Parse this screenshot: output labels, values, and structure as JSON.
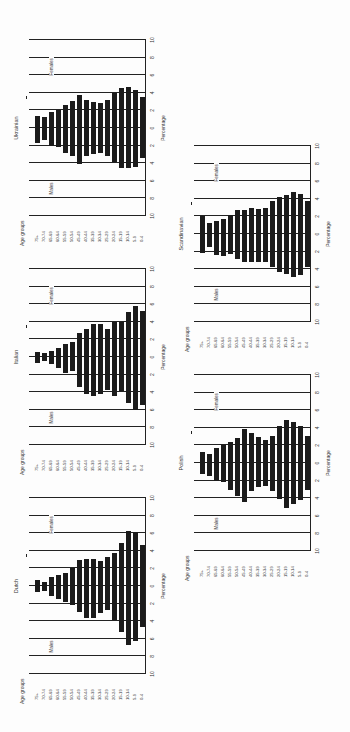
{
  "chart_data": [
    {
      "type": "bar",
      "subtype": "population-pyramid",
      "title": "Ukrainian",
      "xlabel": "Percentage",
      "ylabel": "Age groups",
      "xlim": [
        -10,
        10
      ],
      "xticks": [
        "10",
        "8",
        "6",
        "4",
        "2",
        "0",
        "2",
        "4",
        "6",
        "8",
        "10"
      ],
      "legend": [
        "Males",
        "Females"
      ],
      "categories": [
        "75+",
        "70-74",
        "65-69",
        "60-64",
        "55-59",
        "50-54",
        "45-49",
        "40-44",
        "35-39",
        "30-34",
        "25-29",
        "20-24",
        "15-19",
        "10-14",
        "5-9",
        "0-4"
      ],
      "series": [
        {
          "name": "Males",
          "values": [
            1.7,
            1.4,
            2.0,
            2.2,
            2.8,
            3.2,
            4.1,
            3.2,
            3.0,
            2.8,
            3.2,
            3.9,
            4.6,
            4.6,
            4.4,
            3.4
          ]
        },
        {
          "name": "Females",
          "values": [
            1.4,
            1.2,
            1.8,
            2.1,
            2.6,
            3.1,
            3.8,
            3.2,
            3.0,
            2.8,
            3.2,
            4.0,
            4.5,
            4.7,
            4.3,
            3.5
          ]
        }
      ],
      "position": {
        "left": 11,
        "top": 246
      }
    },
    {
      "type": "bar",
      "subtype": "population-pyramid",
      "title": "Italian",
      "xlabel": "Percentage",
      "ylabel": "Age groups",
      "xlim": [
        -10,
        10
      ],
      "xticks": [
        "10",
        "8",
        "6",
        "4",
        "2",
        "0",
        "2",
        "4",
        "6",
        "8",
        "10"
      ],
      "legend": [
        "Males",
        "Females"
      ],
      "categories": [
        "75+",
        "70-74",
        "65-69",
        "60-64",
        "55-59",
        "50-54",
        "45-49",
        "40-44",
        "35-39",
        "30-34",
        "25-29",
        "20-24",
        "15-19",
        "10-14",
        "5-9",
        "0-4"
      ],
      "series": [
        {
          "name": "Males",
          "values": [
            0.7,
            0.5,
            0.8,
            1.3,
            1.8,
            1.6,
            3.4,
            4.2,
            4.4,
            4.2,
            3.7,
            4.4,
            3.9,
            5.2,
            6.0,
            5.5
          ]
        },
        {
          "name": "Females",
          "values": [
            0.6,
            0.5,
            0.7,
            1.0,
            1.5,
            1.7,
            2.7,
            3.2,
            3.7,
            3.8,
            3.2,
            4.0,
            4.0,
            5.1,
            5.8,
            5.2
          ]
        }
      ],
      "position": {
        "left": 11,
        "top": 475
      }
    },
    {
      "type": "bar",
      "subtype": "population-pyramid",
      "title": "Dutch",
      "xlabel": "Percentage",
      "ylabel": "Age groups",
      "xlim": [
        -10,
        10
      ],
      "xticks": [
        "10",
        "8",
        "6",
        "4",
        "2",
        "0",
        "2",
        "4",
        "6",
        "8",
        "10"
      ],
      "legend": [
        "Males",
        "Females"
      ],
      "categories": [
        "75+",
        "70-74",
        "65-69",
        "60-64",
        "55-59",
        "50-54",
        "45-49",
        "40-44",
        "35-39",
        "30-34",
        "25-29",
        "20-24",
        "15-19",
        "10-14",
        "5-9",
        "0-4"
      ],
      "series": [
        {
          "name": "Males",
          "values": [
            0.7,
            0.6,
            1.1,
            1.5,
            1.8,
            2.2,
            3.0,
            3.6,
            3.6,
            3.1,
            2.7,
            3.9,
            5.2,
            6.7,
            6.3,
            4.7
          ]
        },
        {
          "name": "Females",
          "values": [
            0.7,
            0.5,
            1.0,
            1.3,
            1.5,
            2.1,
            2.9,
            3.1,
            3.1,
            2.8,
            3.3,
            3.7,
            4.9,
            6.3,
            6.1,
            4.7
          ]
        }
      ],
      "position": {
        "left": 11,
        "top": 704
      }
    },
    {
      "type": "bar",
      "subtype": "population-pyramid",
      "title": "Scandinavian",
      "xlabel": "Percentage",
      "ylabel": "Age groups",
      "xlim": [
        -10,
        10
      ],
      "xticks": [
        "10",
        "8",
        "6",
        "4",
        "2",
        "0",
        "2",
        "4",
        "6",
        "8",
        "10"
      ],
      "legend": [
        "Males",
        "Females"
      ],
      "categories": [
        "75+",
        "70-74",
        "65-69",
        "60-64",
        "55-59",
        "50-54",
        "45-49",
        "40-44",
        "35-39",
        "30-34",
        "25-29",
        "20-24",
        "15-19",
        "10-14",
        "5-9",
        "0-4"
      ],
      "series": [
        {
          "name": "Males",
          "values": [
            2.2,
            1.5,
            2.4,
            2.5,
            2.3,
            2.8,
            3.2,
            3.2,
            3.2,
            3.2,
            3.8,
            4.3,
            4.5,
            4.9,
            4.7,
            3.8
          ]
        },
        {
          "name": "Females",
          "values": [
            2.0,
            1.2,
            1.5,
            1.7,
            2.2,
            2.7,
            2.7,
            2.9,
            2.8,
            3.0,
            3.8,
            4.2,
            4.4,
            4.8,
            4.5,
            3.8
          ]
        }
      ],
      "position": {
        "left": 176,
        "top": 352
      }
    },
    {
      "type": "bar",
      "subtype": "population-pyramid",
      "title": "Polish",
      "xlabel": "Percentage",
      "ylabel": "Age groups",
      "xlim": [
        -10,
        10
      ],
      "xticks": [
        "10",
        "8",
        "6",
        "4",
        "2",
        "0",
        "2",
        "4",
        "6",
        "8",
        "10"
      ],
      "legend": [
        "Males",
        "Females"
      ],
      "categories": [
        "75+",
        "70-74",
        "65-69",
        "60-64",
        "55-59",
        "50-54",
        "45-49",
        "40-44",
        "35-39",
        "30-34",
        "25-29",
        "20-24",
        "15-19",
        "10-14",
        "5-9",
        "0-4"
      ],
      "series": [
        {
          "name": "Males",
          "values": [
            1.3,
            1.5,
            2.1,
            2.2,
            3.1,
            3.7,
            4.4,
            3.2,
            2.7,
            2.6,
            3.2,
            4.1,
            5.1,
            4.7,
            4.2,
            3.1
          ]
        },
        {
          "name": "Females",
          "values": [
            1.3,
            1.0,
            1.7,
            2.1,
            2.4,
            2.8,
            3.9,
            3.4,
            2.9,
            2.6,
            3.1,
            4.2,
            4.9,
            4.7,
            4.2,
            3.1
          ]
        }
      ],
      "position": {
        "left": 176,
        "top": 581
      }
    }
  ]
}
